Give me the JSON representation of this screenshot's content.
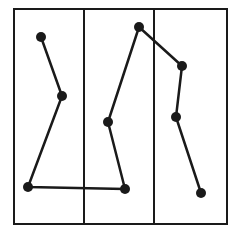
{
  "canvas": {
    "width": 239,
    "height": 231,
    "background": "#ffffff"
  },
  "colors": {
    "stroke": "#1a1a1a",
    "dot": "#1a1a1a"
  },
  "frame": {
    "x": 14,
    "y": 9,
    "width": 213,
    "height": 215
  },
  "dividers": [
    84,
    154
  ],
  "columns": 3,
  "points": [
    {
      "x": 41,
      "y": 37
    },
    {
      "x": 62,
      "y": 96
    },
    {
      "x": 28,
      "y": 187
    },
    {
      "x": 125,
      "y": 189
    },
    {
      "x": 108,
      "y": 122
    },
    {
      "x": 139,
      "y": 27
    },
    {
      "x": 182,
      "y": 66
    },
    {
      "x": 176,
      "y": 117
    },
    {
      "x": 201,
      "y": 193
    }
  ],
  "dot_radius": 5,
  "line_width": 2
}
